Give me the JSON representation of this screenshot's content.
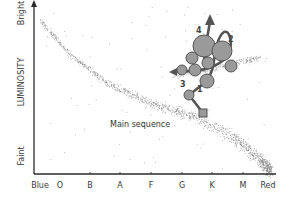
{
  "chart_data": {
    "type": "scatter",
    "title": "",
    "xlabel": "",
    "ylabel": "LUMINOSITY",
    "y_axis": {
      "label": "LUMINOSITY",
      "top_label": "Bright",
      "bottom_label": "Faint"
    },
    "x_axis": {
      "left_label": "Blue",
      "right_label": "Red",
      "ticks": [
        "O",
        "B",
        "A",
        "F",
        "G",
        "K",
        "M"
      ]
    },
    "grid": false,
    "legend": null,
    "annotations": [
      {
        "text": "Main sequence",
        "x": 110,
        "y": 127
      },
      {
        "text": "1",
        "x": 197,
        "y": 92
      },
      {
        "text": "2",
        "x": 228,
        "y": 42
      },
      {
        "text": "3",
        "x": 180,
        "y": 87
      },
      {
        "text": "4",
        "x": 196,
        "y": 33
      }
    ],
    "series": [
      {
        "name": "Main sequence stars",
        "kind": "band",
        "path": [
          [
            40,
            20
          ],
          [
            70,
            55
          ],
          [
            110,
            85
          ],
          [
            150,
            103
          ],
          [
            190,
            115
          ],
          [
            230,
            135
          ],
          [
            260,
            160
          ],
          [
            272,
            172
          ]
        ]
      },
      {
        "name": "Giant branch stars",
        "kind": "band",
        "path": [
          [
            175,
            75
          ],
          [
            210,
            70
          ],
          [
            240,
            62
          ],
          [
            260,
            58
          ]
        ]
      },
      {
        "name": "Evolutionary track",
        "kind": "track",
        "points": [
          [
            203,
            113
          ],
          [
            189,
            95
          ],
          [
            207,
            81
          ],
          [
            214,
            62
          ],
          [
            220,
            38
          ],
          [
            226,
            32
          ],
          [
            230,
            48
          ],
          [
            222,
            60
          ],
          [
            205,
            73
          ],
          [
            172,
            72
          ]
        ],
        "markers": [
          {
            "x": 203,
            "y": 113,
            "r": 4,
            "shape": "square"
          },
          {
            "x": 189,
            "y": 95,
            "r": 5
          },
          {
            "x": 207,
            "y": 81,
            "r": 7
          },
          {
            "x": 182,
            "y": 70,
            "r": 5
          },
          {
            "x": 195,
            "y": 70,
            "r": 6
          },
          {
            "x": 208,
            "y": 63,
            "r": 6
          },
          {
            "x": 231,
            "y": 66,
            "r": 6
          },
          {
            "x": 192,
            "y": 58,
            "r": 6
          },
          {
            "x": 204,
            "y": 46,
            "r": 11
          },
          {
            "x": 222,
            "y": 51,
            "r": 10
          }
        ]
      }
    ],
    "colors": {
      "axis": "#2a2a2a",
      "stars": "#6a6a6a",
      "marker_fill": "#9a9a9a",
      "marker_stroke": "#555555",
      "track": "#555555"
    }
  }
}
